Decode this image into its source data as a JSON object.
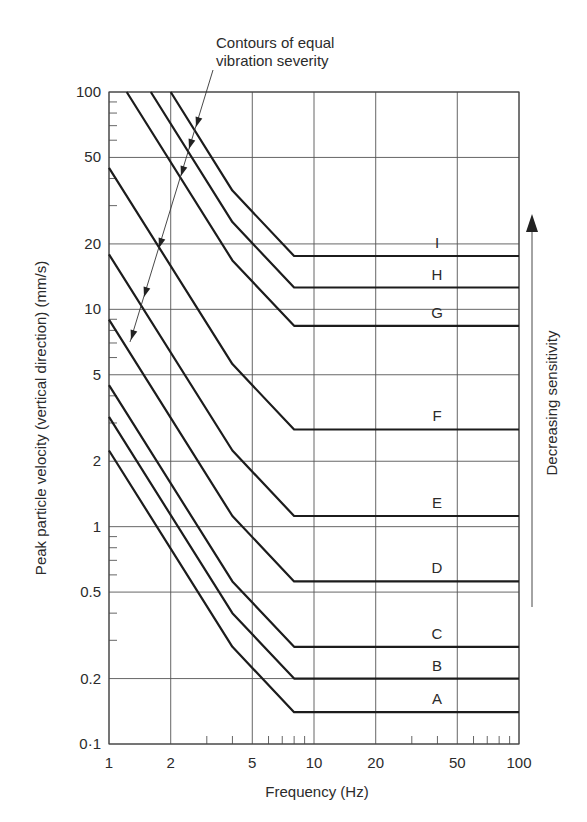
{
  "chart_data": {
    "type": "line",
    "title": "",
    "xlabel": "Frequency (Hz)",
    "ylabel": "Peak particle velocity (vertical direction) (mm/s)",
    "xscale": "log",
    "yscale": "log",
    "xlim": [
      1,
      100
    ],
    "ylim": [
      0.1,
      100
    ],
    "grid": true,
    "legend": "none (curves labelled inline at right)",
    "x_ticks": [
      {
        "value": 1,
        "label": "1"
      },
      {
        "value": 2,
        "label": "2"
      },
      {
        "value": 5,
        "label": "5"
      },
      {
        "value": 10,
        "label": "10"
      },
      {
        "value": 20,
        "label": "20"
      },
      {
        "value": 50,
        "label": "50"
      },
      {
        "value": 100,
        "label": "100"
      }
    ],
    "y_ticks": [
      {
        "value": 100,
        "label": "100"
      },
      {
        "value": 50,
        "label": "50"
      },
      {
        "value": 20,
        "label": "20"
      },
      {
        "value": 10,
        "label": "10"
      },
      {
        "value": 5,
        "label": "5"
      },
      {
        "value": 2,
        "label": "2"
      },
      {
        "value": 1,
        "label": "1"
      },
      {
        "value": 0.5,
        "label": "0.5"
      },
      {
        "value": 0.2,
        "label": "0.2"
      },
      {
        "value": 0.1,
        "label": "0·1"
      }
    ],
    "x_minor_ticks": [
      3,
      4,
      6,
      7,
      8,
      9,
      30,
      40,
      60,
      70,
      80,
      90
    ],
    "y_minor_ticks": [
      0.3,
      0.4,
      0.6,
      0.7,
      0.8,
      0.9,
      3,
      4,
      6,
      7,
      8,
      9,
      30,
      40,
      60,
      70,
      80,
      90
    ],
    "series": [
      {
        "name": "A",
        "points": [
          [
            1,
            2.24
          ],
          [
            4,
            0.28
          ],
          [
            8,
            0.14
          ],
          [
            100,
            0.14
          ]
        ]
      },
      {
        "name": "B",
        "points": [
          [
            1,
            3.2
          ],
          [
            4,
            0.4
          ],
          [
            8,
            0.2
          ],
          [
            100,
            0.2
          ]
        ]
      },
      {
        "name": "C",
        "points": [
          [
            1,
            4.48
          ],
          [
            4,
            0.56
          ],
          [
            8,
            0.28
          ],
          [
            100,
            0.28
          ]
        ]
      },
      {
        "name": "D",
        "points": [
          [
            1,
            8.96
          ],
          [
            4,
            1.12
          ],
          [
            8,
            0.56
          ],
          [
            100,
            0.56
          ]
        ]
      },
      {
        "name": "E",
        "points": [
          [
            1,
            17.9
          ],
          [
            4,
            2.24
          ],
          [
            8,
            1.12
          ],
          [
            100,
            1.12
          ]
        ]
      },
      {
        "name": "F",
        "points": [
          [
            1,
            44.8
          ],
          [
            4,
            5.6
          ],
          [
            8,
            2.8
          ],
          [
            100,
            2.8
          ]
        ]
      },
      {
        "name": "G",
        "points": [
          [
            1.22,
            100
          ],
          [
            4,
            16.8
          ],
          [
            8,
            8.4
          ],
          [
            100,
            8.4
          ]
        ]
      },
      {
        "name": "H",
        "points": [
          [
            1.6,
            100
          ],
          [
            4,
            25.2
          ],
          [
            8,
            12.6
          ],
          [
            100,
            12.6
          ]
        ]
      },
      {
        "name": "I",
        "points": [
          [
            2.0,
            100
          ],
          [
            4,
            35.2
          ],
          [
            8,
            17.6
          ],
          [
            100,
            17.6
          ]
        ]
      }
    ],
    "annotations": [
      {
        "text": "Contours of equal vibration severity",
        "lines": [
          "Contours of equal",
          "vibration severity"
        ],
        "type": "leader-arrows",
        "points_to": [
          "I",
          "H",
          "G",
          "F",
          "E",
          "D"
        ]
      },
      {
        "text": "Decreasing sensitivity",
        "type": "vertical-arrow",
        "direction": "up"
      }
    ]
  },
  "labels": {
    "x_axis_title": "Frequency (Hz)",
    "y_axis_title": "Peak particle velocity (vertical direction) (mm/s)",
    "annotation_line1": "Contours of equal",
    "annotation_line2": "vibration severity",
    "sensitivity_label": "Decreasing sensitivity"
  },
  "colors": {
    "curve": "#1c1c1c",
    "grid": "#555555",
    "text": "#2b2b2b",
    "background": "#ffffff"
  }
}
